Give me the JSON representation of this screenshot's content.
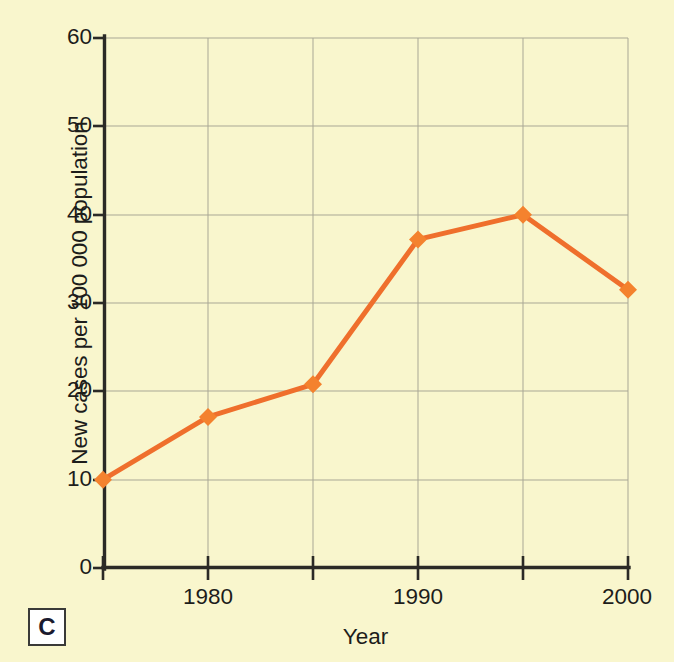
{
  "figure": {
    "panel_label": "C",
    "background_color": "#f9f6cd",
    "axis_color": "#2b2a26",
    "grid_color": "#a9a795",
    "series_color": "#ef6f2c",
    "marker_color": "#f4822e"
  },
  "chart_data": {
    "type": "line",
    "title": "",
    "xlabel": "Year",
    "ylabel": "New cases per 100 000 population",
    "x": [
      1975,
      1980,
      1985,
      1990,
      1995,
      2000
    ],
    "values": [
      10.0,
      17.1,
      20.8,
      37.2,
      40.0,
      31.5
    ],
    "series": [
      {
        "name": "New cases per 100 000 population",
        "values": [
          10.0,
          17.1,
          20.8,
          37.2,
          40.0,
          31.5
        ]
      }
    ],
    "xlim": [
      1975,
      2000
    ],
    "ylim": [
      0,
      60
    ],
    "xticks": [
      1975,
      1980,
      1985,
      1990,
      1995,
      2000
    ],
    "xtick_labels": [
      "",
      "1980",
      "",
      "1990",
      "",
      "2000"
    ],
    "yticks": [
      0,
      10,
      20,
      30,
      40,
      50,
      60
    ],
    "ytick_labels": [
      "0",
      "10",
      "20",
      "30",
      "40",
      "50",
      "60"
    ],
    "grid": true,
    "legend": "none",
    "marker": "diamond"
  }
}
